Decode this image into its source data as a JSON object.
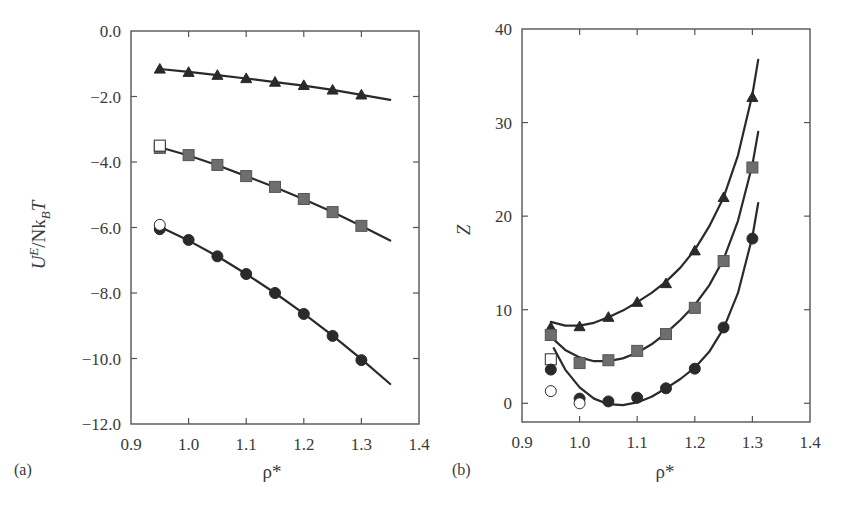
{
  "figure": {
    "background": "#ffffff",
    "ink_color": "#2a2a2a",
    "square_fill": "#6e6e6e"
  },
  "chart_data": [
    {
      "panel_label": "(a)",
      "type": "scatter",
      "title": "",
      "xlabel": "ρ*",
      "ylabel_main": "U",
      "ylabel_sup": "E",
      "ylabel_mid": "/Nk",
      "ylabel_sub": "B",
      "ylabel_end": "T",
      "xlim": [
        0.9,
        1.4
      ],
      "ylim": [
        -12.0,
        0.0
      ],
      "xticks": [
        0.9,
        1.0,
        1.1,
        1.2,
        1.3,
        1.4
      ],
      "xtick_labels": [
        "0.9",
        "1.0",
        "1.1",
        "1.2",
        "1.3",
        "1.4"
      ],
      "yticks": [
        0.0,
        -2.0,
        -4.0,
        -6.0,
        -8.0,
        -10.0,
        -12.0
      ],
      "ytick_labels": [
        "0.0",
        "−2.0",
        "−4.0",
        "−6.0",
        "−8.0",
        "−10.0",
        "−12.0"
      ],
      "grid": false,
      "legend": "none",
      "series": [
        {
          "name": "triangles (filled)",
          "marker": "triangle",
          "filled": true,
          "x": [
            0.95,
            1.0,
            1.05,
            1.1,
            1.15,
            1.2,
            1.25,
            1.3
          ],
          "y": [
            -1.16,
            -1.26,
            -1.35,
            -1.45,
            -1.56,
            -1.66,
            -1.8,
            -1.95
          ],
          "fit_x": [
            0.95,
            1.0,
            1.05,
            1.1,
            1.15,
            1.2,
            1.25,
            1.3,
            1.35
          ],
          "fit_y": [
            -1.16,
            -1.25,
            -1.35,
            -1.45,
            -1.56,
            -1.67,
            -1.8,
            -1.95,
            -2.1
          ]
        },
        {
          "name": "squares (filled)",
          "marker": "square",
          "filled": true,
          "x": [
            0.95,
            1.0,
            1.05,
            1.1,
            1.15,
            1.2,
            1.25,
            1.3
          ],
          "y": [
            -3.57,
            -3.79,
            -4.09,
            -4.43,
            -4.76,
            -5.13,
            -5.53,
            -5.95
          ],
          "fit_x": [
            0.95,
            1.0,
            1.05,
            1.1,
            1.15,
            1.2,
            1.25,
            1.3,
            1.35
          ],
          "fit_y": [
            -3.55,
            -3.8,
            -4.1,
            -4.43,
            -4.77,
            -5.14,
            -5.53,
            -5.95,
            -6.4
          ]
        },
        {
          "name": "squares (open)",
          "marker": "square",
          "filled": false,
          "x": [
            0.95
          ],
          "y": [
            -3.5
          ]
        },
        {
          "name": "circles (filled)",
          "marker": "circle",
          "filled": true,
          "x": [
            0.95,
            1.0,
            1.05,
            1.1,
            1.15,
            1.2,
            1.25,
            1.3
          ],
          "y": [
            -6.05,
            -6.38,
            -6.88,
            -7.42,
            -8.0,
            -8.64,
            -9.31,
            -10.05
          ],
          "fit_x": [
            0.95,
            1.0,
            1.05,
            1.1,
            1.15,
            1.2,
            1.25,
            1.3,
            1.35
          ],
          "fit_y": [
            -5.98,
            -6.4,
            -6.88,
            -7.42,
            -8.0,
            -8.63,
            -9.3,
            -10.02,
            -10.78
          ]
        },
        {
          "name": "circles (open)",
          "marker": "circle",
          "filled": false,
          "x": [
            0.95
          ],
          "y": [
            -5.92
          ]
        }
      ]
    },
    {
      "panel_label": "(b)",
      "type": "scatter",
      "title": "",
      "xlabel": "ρ*",
      "ylabel": "Z",
      "xlim": [
        0.9,
        1.4
      ],
      "ylim": [
        -2,
        40
      ],
      "xticks": [
        0.9,
        1.0,
        1.1,
        1.2,
        1.3,
        1.4
      ],
      "xtick_labels": [
        "0.9",
        "1.0",
        "1.1",
        "1.2",
        "1.3",
        "1.4"
      ],
      "yticks": [
        0,
        10,
        20,
        30,
        40
      ],
      "ytick_labels": [
        "0",
        "10",
        "20",
        "30",
        "40"
      ],
      "grid": false,
      "legend": "none",
      "series": [
        {
          "name": "triangles (filled)",
          "marker": "triangle",
          "filled": true,
          "x": [
            0.95,
            1.0,
            1.05,
            1.1,
            1.15,
            1.2,
            1.25,
            1.3
          ],
          "y": [
            8.1,
            8.2,
            9.2,
            10.8,
            12.8,
            16.3,
            22.0,
            32.7
          ],
          "fit_x": [
            0.95,
            0.975,
            1.0,
            1.025,
            1.05,
            1.075,
            1.1,
            1.125,
            1.15,
            1.175,
            1.2,
            1.225,
            1.25,
            1.275,
            1.3,
            1.31
          ],
          "fit_y": [
            8.7,
            8.3,
            8.3,
            8.6,
            9.2,
            9.9,
            10.8,
            11.8,
            13.0,
            14.5,
            16.4,
            18.9,
            22.0,
            26.5,
            33.0,
            36.7
          ]
        },
        {
          "name": "squares (filled)",
          "marker": "square",
          "filled": true,
          "x": [
            0.95,
            1.0,
            1.05,
            1.1,
            1.15,
            1.2,
            1.25,
            1.3
          ],
          "y": [
            7.3,
            4.3,
            4.6,
            5.6,
            7.4,
            10.2,
            15.2,
            25.2
          ],
          "fit_x": [
            0.95,
            0.975,
            1.0,
            1.025,
            1.05,
            1.075,
            1.1,
            1.125,
            1.15,
            1.175,
            1.2,
            1.225,
            1.25,
            1.275,
            1.3,
            1.31
          ],
          "fit_y": [
            7.1,
            5.7,
            4.9,
            4.5,
            4.5,
            4.8,
            5.4,
            6.3,
            7.5,
            8.9,
            10.5,
            12.6,
            15.4,
            19.5,
            25.5,
            29.0
          ]
        },
        {
          "name": "squares (open)",
          "marker": "square",
          "filled": false,
          "x": [
            0.95
          ],
          "y": [
            4.7
          ]
        },
        {
          "name": "circles (filled)",
          "marker": "circle",
          "filled": true,
          "x": [
            0.95,
            1.0,
            1.05,
            1.1,
            1.15,
            1.2,
            1.25,
            1.3
          ],
          "y": [
            3.6,
            0.5,
            0.2,
            0.6,
            1.6,
            3.7,
            8.1,
            17.6
          ],
          "fit_x": [
            0.955,
            0.975,
            1.0,
            1.025,
            1.05,
            1.075,
            1.1,
            1.125,
            1.15,
            1.175,
            1.2,
            1.225,
            1.25,
            1.275,
            1.3,
            1.31
          ],
          "fit_y": [
            5.9,
            3.6,
            1.7,
            0.5,
            -0.1,
            -0.2,
            0.1,
            0.7,
            1.6,
            2.6,
            3.8,
            5.5,
            8.0,
            11.8,
            17.8,
            21.4
          ]
        },
        {
          "name": "circles (open)",
          "marker": "circle",
          "filled": false,
          "x": [
            0.95,
            1.0
          ],
          "y": [
            1.3,
            0.0
          ]
        }
      ]
    }
  ],
  "layout": {
    "panels": [
      {
        "left": 131,
        "top": 31,
        "right": 419,
        "bottom": 424,
        "ylabel_x": 45,
        "ylabel_y": 235,
        "panel_label_x": 14,
        "panel_label_y": 475,
        "xlabel_x": 272,
        "xlabel_y": 478
      },
      {
        "left": 522,
        "top": 29,
        "right": 810,
        "bottom": 422,
        "ylabel_x": 470,
        "ylabel_y": 230,
        "panel_label_x": 452,
        "panel_label_y": 475,
        "xlabel_x": 665,
        "xlabel_y": 478
      }
    ]
  }
}
